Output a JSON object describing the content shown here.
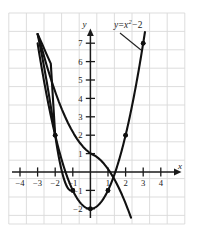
{
  "figure": {
    "name": "parabola-graph",
    "background": "#ffffff",
    "grid_color": "#d9d9d9",
    "axis_color": "#1a1a1a",
    "curve_color": "#111111"
  },
  "annotation": {
    "equation_lhs": "y",
    "equation_eq": "=",
    "equation_base": "x",
    "equation_exponent": "2",
    "equation_minus": "−",
    "equation_constant": "2",
    "equation_full": "y = x² − 2"
  },
  "axes": {
    "x_label": "x",
    "y_label": "y",
    "x_ticks": [
      "−4",
      "−3",
      "−2",
      "−1",
      "1",
      "2",
      "3",
      "4"
    ],
    "y_ticks": [
      "7",
      "6",
      "5",
      "4",
      "3",
      "2",
      "1",
      "−1",
      "−2"
    ]
  },
  "chart_data": {
    "type": "line",
    "title": "",
    "subtitle": "",
    "xlabel": "x",
    "ylabel": "y",
    "xlim": [
      -4.6,
      5.0
    ],
    "ylim": [
      -2.8,
      8.0
    ],
    "grid": true,
    "legend": "none",
    "annotations": [
      {
        "text": "y = x² − 2",
        "points_to": [
          3,
          7
        ],
        "label_x": 2.3,
        "label_y": 8.0
      }
    ],
    "series": [
      {
        "name": "y = x^2 - 2",
        "equation": "y = x^2 - 2",
        "x": [
          -3.0,
          -2.75,
          -2.5,
          -2.25,
          -2.0,
          -1.75,
          -1.5,
          -1.25,
          -1.0,
          -0.75,
          -0.5,
          -0.25,
          0.0,
          0.25,
          0.5,
          0.75,
          1.0,
          1.25,
          1.5,
          1.75,
          2.0,
          2.25,
          2.5,
          2.75,
          3.0,
          3.1
        ],
        "y": [
          7.0,
          5.5625,
          4.25,
          3.0625,
          2.0,
          1.0625,
          0.25,
          -0.4375,
          -1.0,
          -1.4375,
          -1.75,
          -1.9375,
          -2.0,
          -1.9375,
          -1.75,
          -1.4375,
          -1.0,
          -0.4375,
          0.25,
          1.0625,
          2.0,
          3.0625,
          4.25,
          5.5625,
          7.0,
          7.61
        ]
      }
    ],
    "marked_points": [
      {
        "x": -2,
        "y": 2,
        "label": "(-2, 2)"
      },
      {
        "x": -1,
        "y": -1,
        "label": "(-1, -1)"
      },
      {
        "x": 0,
        "y": -2,
        "label": "(0, -2) vertex"
      },
      {
        "x": 1,
        "y": -1,
        "label": "(1, -1)"
      },
      {
        "x": 2,
        "y": 2,
        "label": "(2, 2)"
      },
      {
        "x": 3,
        "y": 7,
        "label": "(3, 7)"
      }
    ],
    "x_tick_values": [
      -4,
      -3,
      -2,
      -1,
      1,
      2,
      3,
      4
    ],
    "y_tick_values": [
      7,
      6,
      5,
      4,
      3,
      2,
      1,
      -1,
      -2
    ]
  }
}
